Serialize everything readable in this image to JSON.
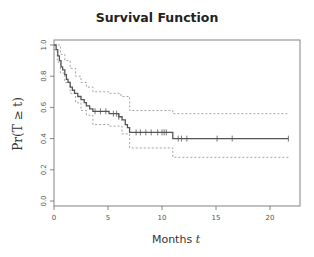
{
  "chart_data": {
    "type": "line",
    "subtype": "kaplan-meier",
    "title": "Survival Function",
    "xlabel": "Months t",
    "xlabel_main": "Months",
    "xlabel_var": "t",
    "ylabel": "Pr(T ≥ t)",
    "xlim": [
      0,
      22.8
    ],
    "ylim": [
      0,
      1.0
    ],
    "x_ticks": [
      0,
      5,
      10,
      15,
      20
    ],
    "y_ticks": [
      0.0,
      0.2,
      0.4,
      0.6,
      0.8,
      1.0
    ],
    "y_tick_labels": [
      "0.0",
      "0.2",
      "0.4",
      "0.6",
      "0.8",
      "1.0"
    ],
    "grid": false,
    "legend": null,
    "series": [
      {
        "name": "survival estimate",
        "style": "solid",
        "color": "#555555",
        "steps": [
          [
            0,
            1.0
          ],
          [
            0.2,
            0.97
          ],
          [
            0.35,
            0.93
          ],
          [
            0.5,
            0.9
          ],
          [
            0.65,
            0.86
          ],
          [
            0.8,
            0.84
          ],
          [
            1.0,
            0.81
          ],
          [
            1.15,
            0.78
          ],
          [
            1.3,
            0.76
          ],
          [
            1.5,
            0.73
          ],
          [
            1.7,
            0.71
          ],
          [
            1.9,
            0.69
          ],
          [
            2.2,
            0.67
          ],
          [
            2.5,
            0.65
          ],
          [
            2.8,
            0.63
          ],
          [
            3.0,
            0.61
          ],
          [
            3.3,
            0.59
          ],
          [
            3.6,
            0.575
          ],
          [
            5.1,
            0.56
          ],
          [
            6.0,
            0.54
          ],
          [
            6.3,
            0.52
          ],
          [
            6.6,
            0.49
          ],
          [
            6.8,
            0.47
          ],
          [
            7.0,
            0.44
          ],
          [
            11.0,
            0.4
          ],
          [
            21.7,
            0.4
          ]
        ],
        "censor_marks": [
          3.8,
          4.3,
          4.8,
          5.5,
          5.8,
          6.0,
          7.6,
          8.0,
          8.5,
          9.0,
          9.6,
          10.0,
          10.2,
          10.4,
          11.5,
          11.8,
          12.3,
          15.1,
          16.5,
          21.7
        ]
      },
      {
        "name": "upper confidence band",
        "style": "dotted",
        "color": "#999999",
        "steps": [
          [
            0,
            1.0
          ],
          [
            0.3,
            1.0
          ],
          [
            0.6,
            0.94
          ],
          [
            1.0,
            0.9
          ],
          [
            1.5,
            0.85
          ],
          [
            2.0,
            0.8
          ],
          [
            2.5,
            0.76
          ],
          [
            3.0,
            0.73
          ],
          [
            3.6,
            0.7
          ],
          [
            5.1,
            0.69
          ],
          [
            6.2,
            0.67
          ],
          [
            7.0,
            0.58
          ],
          [
            11.0,
            0.56
          ],
          [
            21.7,
            0.56
          ]
        ]
      },
      {
        "name": "lower confidence band",
        "style": "dotted",
        "color": "#999999",
        "steps": [
          [
            0,
            0.97
          ],
          [
            0.3,
            0.89
          ],
          [
            0.6,
            0.82
          ],
          [
            1.0,
            0.76
          ],
          [
            1.5,
            0.69
          ],
          [
            2.0,
            0.63
          ],
          [
            2.5,
            0.58
          ],
          [
            3.0,
            0.55
          ],
          [
            3.6,
            0.49
          ],
          [
            5.1,
            0.48
          ],
          [
            6.3,
            0.43
          ],
          [
            7.0,
            0.34
          ],
          [
            11.0,
            0.28
          ],
          [
            21.7,
            0.28
          ]
        ]
      }
    ]
  }
}
